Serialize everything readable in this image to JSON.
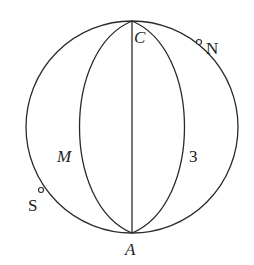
{
  "diagram": {
    "labels": {
      "top": "C",
      "bottom": "A",
      "left_arc": "M",
      "right_arc": "3",
      "north_pole": "N",
      "south_pole": "S"
    },
    "colors": {
      "stroke": "#2a2a2a",
      "background": "#ffffff"
    }
  }
}
